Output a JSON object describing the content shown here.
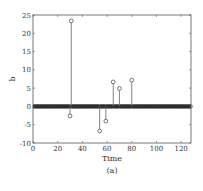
{
  "chart_data": {
    "type": "stem",
    "title": "",
    "xlabel": "Time",
    "ylabel": "b",
    "caption": "(a)",
    "xlim": [
      0,
      128
    ],
    "ylim": [
      -10,
      25
    ],
    "xticks": [
      0,
      20,
      40,
      60,
      80,
      100,
      120
    ],
    "yticks": [
      -10,
      -5,
      0,
      5,
      10,
      15,
      20,
      25
    ],
    "grid": false,
    "legend": null,
    "n_points": 128,
    "baseline_value": 0,
    "nonzero_points": [
      {
        "x": 30,
        "y": -2.6
      },
      {
        "x": 31,
        "y": 23.4
      },
      {
        "x": 54,
        "y": -6.7
      },
      {
        "x": 59,
        "y": -4.0
      },
      {
        "x": 65,
        "y": 6.7
      },
      {
        "x": 70,
        "y": 4.9
      },
      {
        "x": 80,
        "y": 7.2
      }
    ]
  },
  "colors": {
    "axes": "#555555",
    "stem": "#666666",
    "marker": "#555555",
    "baseline_band": "#3a3a3a",
    "text": "#333333"
  }
}
